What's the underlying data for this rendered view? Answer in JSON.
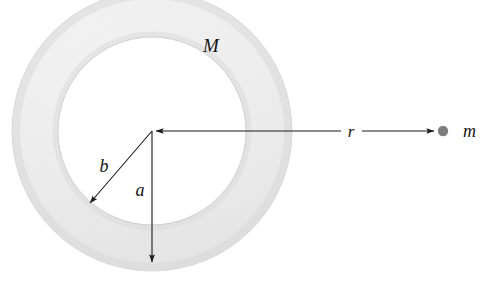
{
  "figure": {
    "background_color": "#ffffff",
    "width": 480,
    "height": 281
  },
  "annulus": {
    "name": "annular-ring",
    "mass_label": "M",
    "center_x": 152,
    "center_y": 131,
    "outer_radius": 140,
    "inner_radius": 94,
    "fill_color": "#e6e6e6",
    "edge_color": "#d2d2d2",
    "shade_light": "#f2f2f2",
    "shade_dark": "#dcdcdc"
  },
  "labels": {
    "mass_ring": "M",
    "inner_radius": "a",
    "outer_radius": "b",
    "distance": "r",
    "point_mass": "m"
  },
  "point_mass": {
    "name": "point-mass-m",
    "label": "m",
    "x": 443,
    "y": 131,
    "radius": 5,
    "color": "#7d7d7d"
  },
  "arrows": {
    "radius_a": {
      "label": "a",
      "from_x": 152,
      "from_y": 131,
      "to_x": 152,
      "to_y": 266,
      "label_x": 140,
      "label_y": 196,
      "color": "#1a1a1a"
    },
    "radius_b": {
      "label": "b",
      "from_x": 152,
      "from_y": 131,
      "to_x": 87,
      "to_y": 206,
      "label_x": 104,
      "label_y": 172,
      "color": "#1a1a1a"
    },
    "distance_r": {
      "label": "r",
      "from_x": 152,
      "from_y": 131,
      "to_x": 436,
      "to_y": 131,
      "gap_start_x": 341,
      "gap_end_x": 362,
      "label_x": 351,
      "label_y": 137,
      "color": "#1a1a1a"
    }
  },
  "mass_label_position": {
    "x": 211,
    "y": 52
  }
}
